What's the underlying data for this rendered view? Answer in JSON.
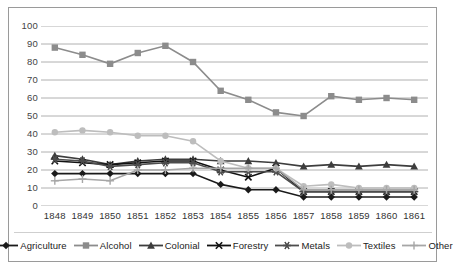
{
  "chart_data": {
    "type": "line",
    "title": "",
    "subtitle": "",
    "xlabel": "",
    "ylabel": "",
    "categories": [
      "1848",
      "1849",
      "1850",
      "1851",
      "1852",
      "1853",
      "1854",
      "1855",
      "1856",
      "1857",
      "1858",
      "1859",
      "1860",
      "1861"
    ],
    "x": [
      1848,
      1849,
      1850,
      1851,
      1852,
      1853,
      1854,
      1855,
      1856,
      1857,
      1858,
      1859,
      1860,
      1861
    ],
    "ylim": [
      0,
      100
    ],
    "y_ticks": [
      0,
      10,
      20,
      30,
      40,
      50,
      60,
      70,
      80,
      90,
      100
    ],
    "grid": "horizontal",
    "legend_position": "bottom",
    "series": [
      {
        "name": "Agriculture",
        "color": "#1a1a1a",
        "marker": "diamond",
        "values": [
          18,
          18,
          18,
          18,
          18,
          18,
          12,
          9,
          9,
          5,
          5,
          5,
          5,
          5
        ]
      },
      {
        "name": "Alcohol",
        "color": "#8c8c8c",
        "marker": "square",
        "values": [
          88,
          84,
          79,
          85,
          89,
          80,
          64,
          59,
          52,
          50,
          61,
          59,
          60,
          59
        ]
      },
      {
        "name": "Colonial",
        "color": "#3d3d3d",
        "marker": "triangle",
        "values": [
          28,
          26,
          23,
          25,
          26,
          26,
          25,
          25,
          24,
          22,
          23,
          22,
          23,
          22
        ]
      },
      {
        "name": "Forestry",
        "color": "#111111",
        "marker": "cross",
        "values": [
          25,
          24,
          23,
          24,
          25,
          25,
          20,
          16,
          21,
          8,
          8,
          8,
          8,
          8
        ]
      },
      {
        "name": "Metals",
        "color": "#4d4d4d",
        "marker": "star",
        "values": [
          26,
          25,
          22,
          23,
          24,
          24,
          19,
          19,
          19,
          8,
          8,
          8,
          8,
          8
        ]
      },
      {
        "name": "Textiles",
        "color": "#bdbdbd",
        "marker": "circle",
        "values": [
          41,
          42,
          41,
          39,
          39,
          36,
          25,
          21,
          21,
          11,
          12,
          10,
          10,
          10
        ]
      },
      {
        "name": "Other",
        "color": "#a6a6a6",
        "marker": "plus",
        "values": [
          14,
          15,
          14,
          20,
          20,
          21,
          21,
          21,
          21,
          9,
          9,
          9,
          9,
          9
        ]
      }
    ]
  },
  "axes": {
    "y_tick_labels": [
      "100",
      "90",
      "80",
      "70",
      "60",
      "50",
      "40",
      "30",
      "20",
      "10",
      "0"
    ],
    "x_tick_labels": [
      "1848",
      "1849",
      "1850",
      "1851",
      "1852",
      "1853",
      "1854",
      "1855",
      "1856",
      "1857",
      "1858",
      "1859",
      "1860",
      "1861"
    ]
  },
  "legend": {
    "items": [
      {
        "label": "Agriculture",
        "icon": "diamond-marker-icon"
      },
      {
        "label": "Alcohol",
        "icon": "square-marker-icon"
      },
      {
        "label": "Colonial",
        "icon": "triangle-marker-icon"
      },
      {
        "label": "Forestry",
        "icon": "cross-marker-icon"
      },
      {
        "label": "Metals",
        "icon": "star-marker-icon"
      },
      {
        "label": "Textiles",
        "icon": "circle-marker-icon"
      },
      {
        "label": "Other",
        "icon": "plus-marker-icon"
      }
    ]
  }
}
